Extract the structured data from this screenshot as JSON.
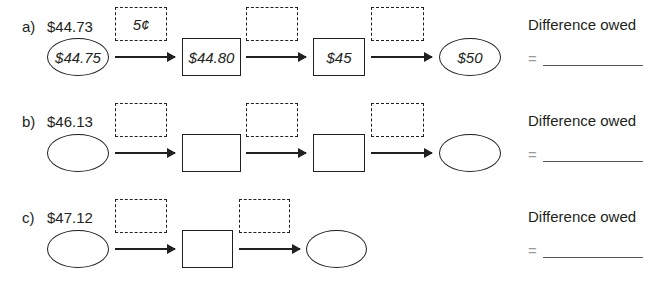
{
  "problems": [
    {
      "letter": "a)",
      "amount": "$44.73",
      "start_oval": "$44.75",
      "jumps": [
        "5¢",
        "",
        ""
      ],
      "boxes": [
        "$44.80",
        "$45"
      ],
      "end_oval": "$50",
      "difference_label": "Difference owed",
      "equals": "=",
      "answer": ""
    },
    {
      "letter": "b)",
      "amount": "$46.13",
      "start_oval": "",
      "jumps": [
        "",
        "",
        ""
      ],
      "boxes": [
        "",
        ""
      ],
      "end_oval": "",
      "difference_label": "Difference owed",
      "equals": "=",
      "answer": ""
    },
    {
      "letter": "c)",
      "amount": "$47.12",
      "start_oval": "",
      "jumps": [
        "",
        ""
      ],
      "boxes": [
        ""
      ],
      "end_oval": "",
      "difference_label": "Difference owed",
      "equals": "=",
      "answer": ""
    }
  ]
}
